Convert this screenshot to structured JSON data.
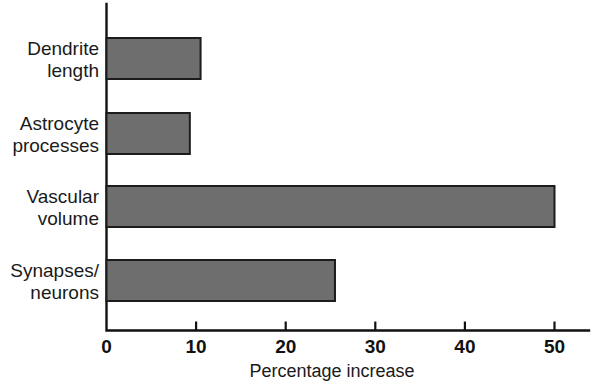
{
  "chart_data": {
    "type": "bar",
    "orientation": "horizontal",
    "title": "",
    "subtitle": "",
    "xlabel": "Percentage increase",
    "ylabel": "",
    "xlim": [
      0,
      55
    ],
    "xticks": [
      0,
      10,
      20,
      30,
      40,
      50
    ],
    "xtick_labels": [
      "0",
      "10",
      "20",
      "30",
      "40",
      "50"
    ],
    "grid": false,
    "legend": false,
    "legend_position": "none",
    "categories": [
      "Dendrite length",
      "Astrocyte processes",
      "Vascular volume",
      "Synapses/neurons"
    ],
    "values": [
      10.5,
      9.3,
      50.0,
      25.5
    ],
    "bar_color": "#6e6e6e",
    "bar_edge_color": "#1c1c1c",
    "axis_color": "#111111",
    "background_color": "#ffffff"
  },
  "axis": {
    "x_title": "Percentage increase",
    "ticks": [
      {
        "value": 0,
        "label": "0"
      },
      {
        "value": 10,
        "label": "10"
      },
      {
        "value": 20,
        "label": "20"
      },
      {
        "value": 30,
        "label": "30"
      },
      {
        "value": 40,
        "label": "40"
      },
      {
        "value": 50,
        "label": "50"
      }
    ]
  },
  "bars": [
    {
      "label_line1": "Dendrite",
      "label_line2": "length",
      "value": 10.5
    },
    {
      "label_line1": "Astrocyte",
      "label_line2": "processes",
      "value": 9.3
    },
    {
      "label_line1": "Vascular",
      "label_line2": "volume",
      "value": 50.0
    },
    {
      "label_line1": "Synapses/",
      "label_line2": "neurons",
      "value": 25.5
    }
  ]
}
